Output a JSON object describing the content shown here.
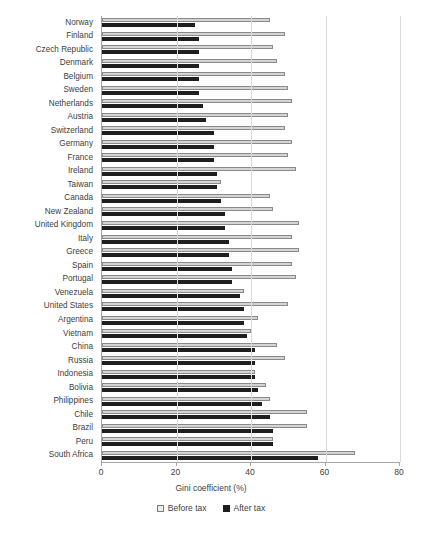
{
  "chart_data": {
    "type": "bar",
    "orientation": "horizontal",
    "title": "",
    "xlabel": "Gini coefficient (%)",
    "ylabel": "",
    "xlim": [
      0,
      80
    ],
    "xticks": [
      0,
      20,
      40,
      60,
      80
    ],
    "grid": true,
    "legend_position": "bottom",
    "categories": [
      "Norway",
      "Finland",
      "Czech Republic",
      "Denmark",
      "Belgium",
      "Sweden",
      "Netherlands",
      "Austria",
      "Switzerland",
      "Germany",
      "France",
      "Ireland",
      "Taiwan",
      "Canada",
      "New Zealand",
      "United Kingdom",
      "Italy",
      "Greece",
      "Spain",
      "Portugal",
      "Venezuela",
      "United States",
      "Argentina",
      "Vietnam",
      "China",
      "Russia",
      "Indonesia",
      "Bolivia",
      "Philippines",
      "Chile",
      "Brazil",
      "Peru",
      "South Africa"
    ],
    "series": [
      {
        "name": "Before tax",
        "color": "#d4d4d4",
        "values": [
          45,
          49,
          46,
          47,
          49,
          50,
          51,
          50,
          49,
          51,
          50,
          52,
          32,
          45,
          46,
          53,
          51,
          53,
          51,
          52,
          38,
          50,
          42,
          40,
          47,
          49,
          41,
          44,
          45,
          55,
          55,
          46,
          68
        ]
      },
      {
        "name": "After tax",
        "color": "#1f1f1f",
        "values": [
          25,
          26,
          26,
          26,
          26,
          26,
          27,
          28,
          30,
          30,
          30,
          31,
          31,
          32,
          33,
          33,
          34,
          34,
          35,
          35,
          37,
          38,
          38,
          39,
          41,
          41,
          41,
          42,
          43,
          45,
          46,
          46,
          58
        ]
      }
    ]
  },
  "axis": {
    "xlabel": "Gini coefficient (%)",
    "tick_labels": [
      "0",
      "20",
      "40",
      "60",
      "80"
    ]
  },
  "legend": {
    "items": [
      {
        "label": "Before tax",
        "swatch": "before-tax-swatch"
      },
      {
        "label": "After tax",
        "swatch": "after-tax-swatch"
      }
    ]
  }
}
